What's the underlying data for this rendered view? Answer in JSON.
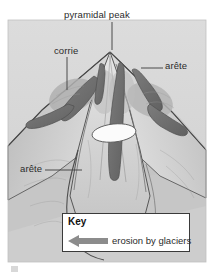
{
  "figure": {
    "type": "diagram",
    "background_color": "#ffffff",
    "panel_color": "#d7d7d7"
  },
  "labels": {
    "pyramidal_peak": "pyramidal peak",
    "corrie": "corrie",
    "arete_right": "arête",
    "arete_left": "arête"
  },
  "key": {
    "title": "Key",
    "arrow_label": "erosion by glaciers",
    "arrow_icon": "left-arrow-icon",
    "arrow_color": "#8c8c8c",
    "border_color": "#3a3a3a",
    "background_color": "#ffffff"
  },
  "colors": {
    "mountain_light": "#e2e2e2",
    "mountain_mid": "#c9c9c9",
    "mountain_shadow": "#a8a8a8",
    "glacier_dark": "#6e6e6e",
    "tarn_white": "#fbfbfb",
    "outline": "#4a4a4a",
    "label_text": "#2b2b2b"
  }
}
